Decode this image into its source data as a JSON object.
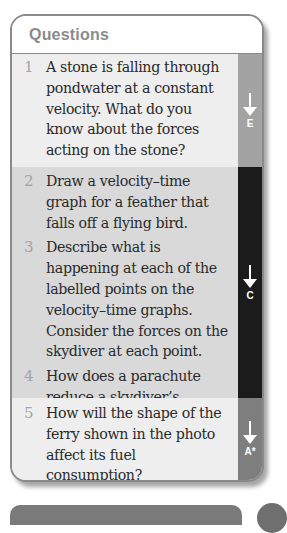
{
  "panel": {
    "title": "Questions"
  },
  "bands": [
    {
      "grade": "E",
      "questions": [
        {
          "number": "1",
          "text": "A stone is falling through pondwater at a constant velocity. What do you know about the forces acting on the stone?"
        }
      ]
    },
    {
      "grade": "C",
      "questions": [
        {
          "number": "2",
          "text": "Draw a velocity–time graph for a feather that falls off a flying bird."
        },
        {
          "number": "3",
          "text": "Describe what is happening at each of the labelled points on the velocity–time graphs. Consider the forces on the skydiver at each point."
        },
        {
          "number": "4",
          "text": "How does a parachute reduce a skydiver’s terminal velocity?"
        }
      ]
    },
    {
      "grade": "A*",
      "questions": [
        {
          "number": "5",
          "text": "How will the shape of the ferry shown in the photo affect its fuel consumption?"
        }
      ]
    }
  ],
  "colors": {
    "band_light": "#eeeeee",
    "band_mid": "#d9d9d9",
    "side_e": "#a3a3a3",
    "side_c": "#1b1b1b",
    "side_a": "#7e7e7e",
    "number": "#a3a3a3",
    "title": "#8b8b8b"
  }
}
